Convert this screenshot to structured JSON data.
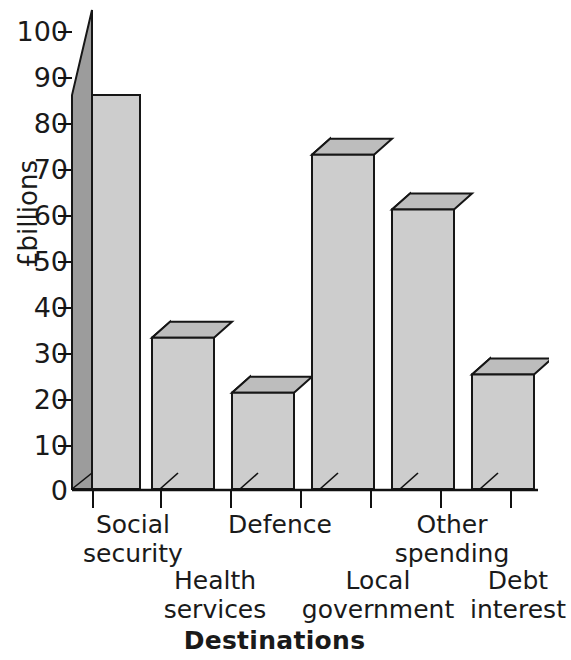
{
  "chart_data": {
    "type": "bar",
    "title": "",
    "subtitle": "",
    "xlabel": "Destinations",
    "ylabel": "£billions",
    "categories": [
      "Social security",
      "Health services",
      "Defence",
      "Local government",
      "Other spending",
      "Debt interest"
    ],
    "category_lines": [
      [
        "Social",
        "security"
      ],
      [
        "Health",
        "services"
      ],
      [
        "Defence",
        ""
      ],
      [
        "Local",
        "government"
      ],
      [
        "Other",
        "spending"
      ],
      [
        "Debt",
        "interest"
      ]
    ],
    "values": [
      86,
      33,
      21,
      73,
      61,
      25
    ],
    "ylim": [
      0,
      100
    ],
    "yticks": [
      0,
      10,
      20,
      30,
      40,
      50,
      60,
      70,
      80,
      90,
      100
    ],
    "ytick_labels": [
      "0",
      "10",
      "20",
      "30",
      "40",
      "50",
      "60",
      "70",
      "80",
      "90",
      "100"
    ],
    "grid": false,
    "legend": null,
    "style": "3d-bar",
    "colors": {
      "bar_front": "#cdcdcd",
      "bar_side": "#9c9c9c",
      "bar_top": "#bdbdbd",
      "outline": "#161616",
      "text": "#1a1a1a",
      "background": "#ffffff"
    }
  },
  "axis": {
    "y_title": "£billions",
    "x_title": "Destinations"
  }
}
